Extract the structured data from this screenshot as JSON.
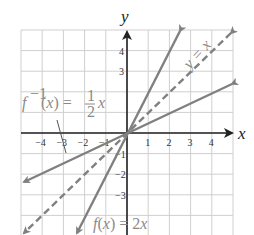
{
  "chart_data": {
    "type": "line",
    "title": "",
    "xlabel": "x",
    "ylabel": "y",
    "xlim": [
      -5,
      5
    ],
    "ylim": [
      -5,
      5
    ],
    "grid": true,
    "x_ticks": [
      "-4",
      "-3",
      "-2",
      "-1",
      "1",
      "2",
      "3",
      "4"
    ],
    "y_ticks": [
      "4",
      "3",
      "-1",
      "-2",
      "-3"
    ],
    "series": [
      {
        "name": "f(x) = 2x",
        "style": "solid",
        "x": [
          -2.4,
          2.5
        ],
        "y": [
          -4.9,
          5.0
        ],
        "color": "#808080"
      },
      {
        "name": "y = x",
        "style": "dashed",
        "x": [
          -5,
          5
        ],
        "y": [
          -5,
          4.9
        ],
        "color": "#808080"
      },
      {
        "name": "f^-1(x) = 1/2 x",
        "style": "solid",
        "x": [
          -5,
          5
        ],
        "y": [
          -2.4,
          2.4
        ],
        "color": "#808080"
      }
    ],
    "annotations": [
      {
        "text": "f(x) = 2x",
        "near": "bottom center"
      },
      {
        "text": "y = x",
        "near": "upper right, rotated along dashed line"
      },
      {
        "text": "f^-1(x) = 1/2 x",
        "near": "upper left with pointer line to inverse graph"
      }
    ]
  },
  "labels": {
    "x_axis": "x",
    "y_axis": "y",
    "f_label": "f(x) = 2x",
    "identity_label": "y = x",
    "inverse_f": "f",
    "inverse_sup": "−1",
    "inverse_rest": "(x) = ",
    "inverse_num": "1",
    "inverse_den": "2",
    "inverse_x": "x"
  },
  "ticks": {
    "x": [
      {
        "v": -4,
        "t": "−4"
      },
      {
        "v": -3,
        "t": "−3"
      },
      {
        "v": -2,
        "t": "−2"
      },
      {
        "v": -1,
        "t": "−1"
      },
      {
        "v": 1,
        "t": "1"
      },
      {
        "v": 2,
        "t": "2"
      },
      {
        "v": 3,
        "t": "3"
      },
      {
        "v": 4,
        "t": "4"
      }
    ],
    "y": [
      {
        "v": 4,
        "t": "4"
      },
      {
        "v": 3,
        "t": "3"
      },
      {
        "v": -1,
        "t": "−1"
      },
      {
        "v": -2,
        "t": "−2"
      },
      {
        "v": -3,
        "t": "−3"
      }
    ]
  }
}
